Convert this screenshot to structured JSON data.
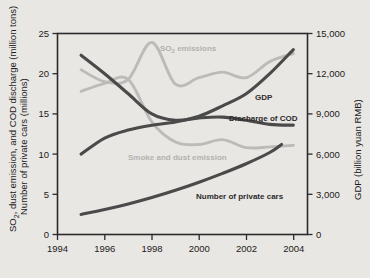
{
  "chart_data": {
    "type": "line",
    "title": "",
    "xlabel": "",
    "ylabel": "SO2, dust emission, and COD discharge (million tons)  Number of private cars (millions)",
    "ylabel_line1": "SO",
    "ylabel_sub": "2",
    "ylabel_line1_rest": ", dust emission, and COD discharge (million tons)",
    "ylabel_line2": "Number of private cars (millions)",
    "y2label": "GDP (billion yuan RMB)",
    "xlim": [
      1994,
      2004.6
    ],
    "ylim": [
      0,
      25
    ],
    "y2lim": [
      0,
      15000
    ],
    "grid": false,
    "legend": "inline-annotations",
    "xticks": [
      1994,
      1996,
      1998,
      2000,
      2002,
      2004
    ],
    "xtick_labels": [
      "1994",
      "1996",
      "1998",
      "2000",
      "2002",
      "2004"
    ],
    "yticks": [
      0,
      5,
      10,
      15,
      20,
      25
    ],
    "ytick_labels": [
      "0",
      "5",
      "10",
      "15",
      "20",
      "25"
    ],
    "y2ticks": [
      0,
      3000,
      6000,
      9000,
      12000,
      15000
    ],
    "y2tick_labels": [
      "0",
      "3,000",
      "6,000",
      "9,000",
      "12,000",
      "15,000"
    ],
    "x": [
      1995,
      1996,
      1997,
      1998,
      1999,
      2000,
      2001,
      2002,
      2003,
      2004
    ],
    "series": [
      {
        "name": "SO2 emissions",
        "label": "SO2 emissions",
        "color": "#bdbbb8",
        "tone": "light",
        "axis": "left",
        "unit": "million tons",
        "values": [
          20.5,
          19.0,
          19.3,
          23.9,
          18.7,
          19.5,
          20.2,
          19.5,
          21.5,
          22.5
        ]
      },
      {
        "name": "Smoke and dust emission",
        "label": "Smoke and dust emission",
        "color": "#bdbbb8",
        "tone": "light",
        "axis": "left",
        "unit": "million tons",
        "values": [
          17.8,
          18.8,
          19.3,
          14.0,
          11.5,
          11.2,
          11.8,
          10.8,
          10.9,
          11.1
        ]
      },
      {
        "name": "Discharge of COD",
        "label": "Discharge of COD",
        "color": "#4a4a4a",
        "tone": "dark",
        "axis": "left",
        "unit": "million tons",
        "values": [
          22.3,
          20.0,
          17.5,
          15.0,
          14.2,
          14.5,
          14.6,
          14.2,
          13.7,
          13.6
        ]
      },
      {
        "name": "GDP",
        "label": "GDP",
        "color": "#4a4a4a",
        "tone": "dark",
        "axis": "right",
        "unit": "billion yuan RMB",
        "values_left_scale": [
          10.0,
          12.0,
          13.0,
          13.6,
          14.0,
          14.7,
          16.0,
          17.5,
          20.0,
          23.0
        ],
        "values": [
          6000,
          7200,
          7800,
          8160,
          8400,
          8820,
          9600,
          10500,
          12000,
          13800
        ]
      },
      {
        "name": "Number of private cars",
        "label": "Number of private cars",
        "color": "#4a4a4a",
        "tone": "dark",
        "axis": "left",
        "unit": "millions",
        "values": [
          2.5,
          3.1,
          3.8,
          4.6,
          5.5,
          6.5,
          7.6,
          8.8,
          10.2,
          12.2
        ],
        "x_range_end": 2003.5
      }
    ],
    "annotations": [
      {
        "text": "SO2 emissions",
        "x": 2000.0,
        "y": 21.3,
        "tone": "light"
      },
      {
        "text": "Smoke and dust emission",
        "x": 1998.6,
        "y": 9.6,
        "tone": "light"
      },
      {
        "text": "GDP",
        "x": 2002.5,
        "y": 17.3,
        "tone": "dark"
      },
      {
        "text": "Discharge of COD",
        "x": 2002.3,
        "y": 14.9,
        "tone": "dark"
      },
      {
        "text": "Number of private cars",
        "x": 2000.8,
        "y": 4.9,
        "tone": "dark"
      }
    ],
    "colors": {
      "background": "#e9e7e4",
      "plot_background": "#e9e7e4",
      "axis": "#2b2b2b",
      "dark_series": "#4a4a4a",
      "light_series": "#bdbbb8"
    }
  }
}
